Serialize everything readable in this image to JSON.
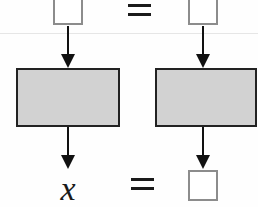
{
  "figure": {
    "background_color": "#fefefe",
    "shaded_box_fill": "#d2d2d2",
    "shaded_box_stroke": "#222222",
    "open_square_stroke": "#8c8c8c",
    "arrow_color": "#111111",
    "rule_color": "#e6e6e6"
  },
  "rows": {
    "top": {
      "left_placeholder": {
        "icon": "empty-square-icon",
        "label": ""
      },
      "operator": {
        "icon": "equals-icon",
        "label": "="
      },
      "right_placeholder": {
        "icon": "empty-square-icon",
        "label": ""
      }
    },
    "middle": {
      "left_process": {
        "icon": "shaded-rectangle-icon",
        "label": ""
      },
      "right_process": {
        "icon": "shaded-rectangle-icon",
        "label": ""
      }
    },
    "bottom": {
      "left_result": {
        "label": "x"
      },
      "operator": {
        "icon": "equals-icon",
        "label": "="
      },
      "right_result": {
        "icon": "empty-square-icon",
        "label": ""
      }
    }
  },
  "connectors": {
    "top_left_arrow": {
      "icon": "down-arrow-icon",
      "label": ""
    },
    "top_right_arrow": {
      "icon": "down-arrow-icon",
      "label": ""
    },
    "bottom_left_arrow": {
      "icon": "down-arrow-icon",
      "label": ""
    },
    "bottom_right_arrow": {
      "icon": "down-arrow-icon",
      "label": ""
    }
  }
}
